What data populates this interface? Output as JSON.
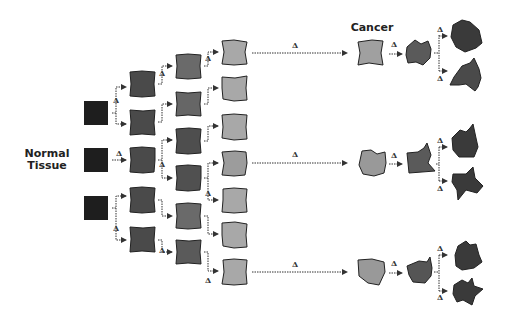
{
  "diagram": {
    "labels": {
      "normal_tissue_line1": "Normal",
      "normal_tissue_line2": "Tissue",
      "cancer": "Cancer"
    },
    "mutation_symbol": "Δ",
    "colors": {
      "normal": "#1e1e1e",
      "generation1": "#4a4a4a",
      "generation2": "#6a6a6a",
      "generation3": "#a8a8a8",
      "cancer_early": "#9c9c9c",
      "cancer_mid": "#5a5a5a",
      "cancer_late": "#3a3a3a",
      "arrow": "#333333"
    },
    "stages": [
      {
        "name": "normal",
        "count": 3
      },
      {
        "name": "generation1",
        "count": 5
      },
      {
        "name": "generation2",
        "count": 6
      },
      {
        "name": "generation3",
        "count": 7
      },
      {
        "name": "cancer_lineages",
        "count": 3,
        "branches_per_lineage": 2
      }
    ]
  }
}
